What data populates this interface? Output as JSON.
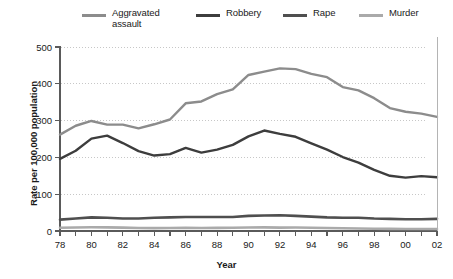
{
  "chart_data": {
    "type": "line",
    "title": "",
    "subtitle": "",
    "xlabel": "Year",
    "ylabel": "Rate per 100,000 population",
    "x": [
      78,
      79,
      80,
      81,
      82,
      83,
      84,
      85,
      86,
      87,
      88,
      89,
      90,
      91,
      92,
      93,
      94,
      95,
      96,
      97,
      98,
      99,
      0,
      1,
      2
    ],
    "x_tick_labels": [
      "78",
      "80",
      "82",
      "84",
      "86",
      "88",
      "90",
      "92",
      "94",
      "96",
      "98",
      "00",
      "02"
    ],
    "x_tick_values": [
      78,
      80,
      82,
      84,
      86,
      88,
      90,
      92,
      94,
      96,
      98,
      0,
      2
    ],
    "xlim": [
      78,
      102
    ],
    "ylim": [
      0,
      500
    ],
    "y_ticks": [
      0,
      100,
      200,
      300,
      400,
      500
    ],
    "y_tick_labels": [
      "0",
      "100",
      "200",
      "300",
      "400",
      "500"
    ],
    "grid": "horizontal-dotted",
    "legend_position": "top",
    "series": [
      {
        "name": "Aggravated\nassault",
        "name_plain": "Aggravated assault",
        "color": "#8c8c8c",
        "values": [
          262,
          286,
          299,
          289,
          289,
          279,
          290,
          303,
          347,
          352,
          372,
          385,
          424,
          433,
          442,
          440,
          427,
          418,
          391,
          382,
          361,
          334,
          324,
          319,
          310
        ]
      },
      {
        "name": "Robbery",
        "name_plain": "Robbery",
        "color": "#3d3d3d",
        "values": [
          196,
          218,
          251,
          259,
          239,
          217,
          205,
          209,
          226,
          213,
          221,
          234,
          257,
          273,
          264,
          256,
          238,
          221,
          201,
          186,
          166,
          150,
          145,
          149,
          146
        ]
      },
      {
        "name": "Rape",
        "name_plain": "Rape",
        "color": "#4f4f4f",
        "values": [
          31,
          34,
          37,
          36,
          34,
          34,
          36,
          37,
          38,
          38,
          38,
          38,
          41,
          42,
          43,
          41,
          39,
          37,
          36,
          36,
          34,
          33,
          32,
          32,
          33
        ]
      },
      {
        "name": "Murder",
        "name_plain": "Murder",
        "color": "#aaaaaa",
        "values": [
          9.0,
          9.7,
          10.2,
          9.8,
          9.1,
          8.3,
          7.9,
          8.0,
          8.6,
          8.3,
          8.4,
          8.7,
          9.4,
          9.8,
          9.3,
          9.5,
          9.0,
          8.2,
          7.4,
          6.8,
          6.3,
          5.7,
          5.5,
          5.6,
          5.6
        ]
      }
    ]
  },
  "geometry": {
    "plot_left": 60,
    "plot_right": 437,
    "plot_top": 47,
    "plot_bottom": 231,
    "grid_right": 426
  },
  "legend": {
    "items": [
      {
        "label": "Aggravated\nassault",
        "color": "#8c8c8c",
        "name": "legend-aggravated-assault"
      },
      {
        "label": "Robbery",
        "color": "#3d3d3d",
        "name": "legend-robbery"
      },
      {
        "label": "Rape",
        "color": "#4f4f4f",
        "name": "legend-rape"
      },
      {
        "label": "Murder",
        "color": "#aaaaaa",
        "name": "legend-murder"
      }
    ]
  }
}
